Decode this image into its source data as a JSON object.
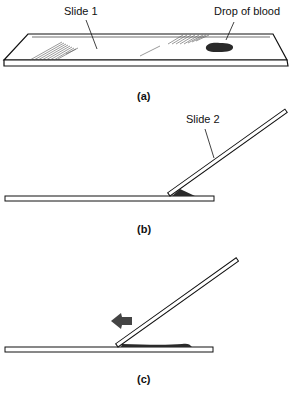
{
  "figure": {
    "panels": [
      {
        "id": "a",
        "caption": "(a)",
        "labels": {
          "slide1": "Slide 1",
          "drop": "Drop of blood"
        }
      },
      {
        "id": "b",
        "caption": "(b)",
        "labels": {
          "slide2": "Slide 2"
        }
      },
      {
        "id": "c",
        "caption": "(c)",
        "arrow_direction": "left"
      }
    ],
    "colors": {
      "ink": "#111111",
      "background": "#ffffff",
      "blood": "#2a2a2a"
    }
  }
}
